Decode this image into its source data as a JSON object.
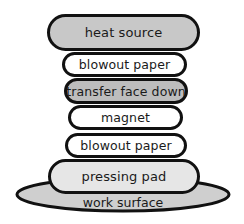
{
  "diagram": {
    "title": "",
    "colors": {
      "outline": "#111111",
      "gray_fill": "#c8c8c8",
      "light_fill": "#e6e6e6",
      "white_fill": "#ffffff"
    },
    "layers": [
      {
        "label": "heat source",
        "fill": "#c8c8c8"
      },
      {
        "label": "blowout paper",
        "fill": "#ffffff"
      },
      {
        "label": "transfer face down",
        "fill": "#bdbdbd"
      },
      {
        "label": "magnet",
        "fill": "#ffffff"
      },
      {
        "label": "blowout paper",
        "fill": "#ffffff"
      },
      {
        "label": "pressing pad",
        "fill": "#e6e6e6"
      }
    ],
    "base": {
      "label": "work surface",
      "fill": "#cfcfcf"
    }
  }
}
